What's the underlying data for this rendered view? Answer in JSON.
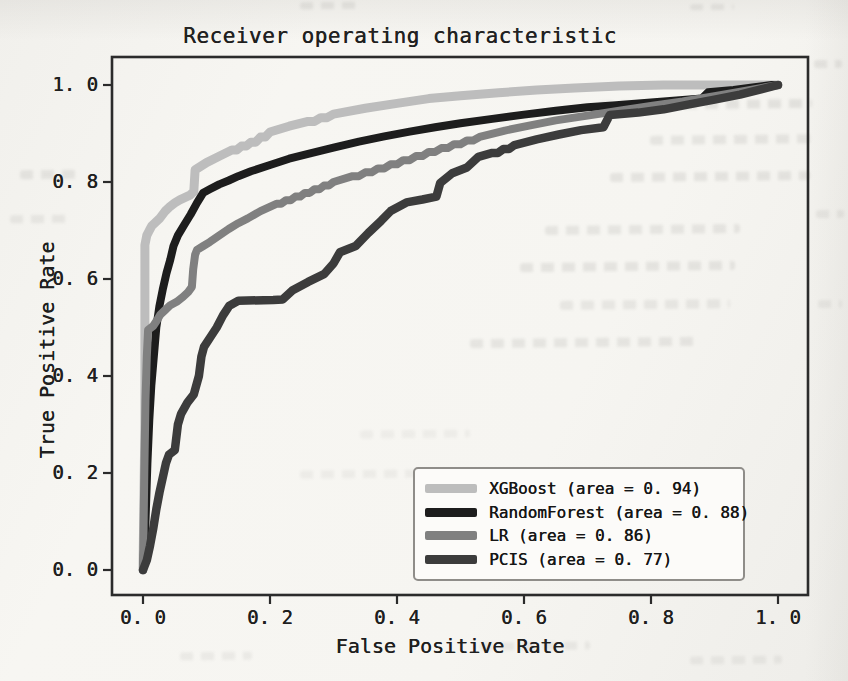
{
  "chart_data": {
    "type": "line",
    "chart_kind": "roc-curve",
    "title": "Receiver operating characteristic",
    "xlabel": "False Positive Rate",
    "ylabel": "True Positive Rate",
    "xlim": [
      -0.05,
      1.05
    ],
    "ylim": [
      -0.05,
      1.05
    ],
    "grid": false,
    "legend_position": "lower right",
    "x_ticks": {
      "values": [
        0,
        0.2,
        0.4,
        0.6,
        0.8,
        1.0
      ],
      "labels": [
        "0. 0",
        "0. 2",
        "0. 4",
        "0. 6",
        "0. 8",
        "1. 0"
      ]
    },
    "y_ticks": {
      "values": [
        0,
        0.2,
        0.4,
        0.6,
        0.8,
        1.0
      ],
      "labels": [
        "0. 0",
        "0. 2",
        "0. 4",
        "0. 6",
        "0. 8",
        "1. 0"
      ]
    },
    "series": [
      {
        "name": "XGBoost",
        "auc": 0.94,
        "color": "#bdbdbd",
        "line_width": 9,
        "legend_label": "XGBoost (area = 0. 94)",
        "points": [
          [
            0,
            0
          ],
          [
            0.003,
            0.3
          ],
          [
            0.003,
            0.67
          ],
          [
            0.006,
            0.69
          ],
          [
            0.01,
            0.7
          ],
          [
            0.014,
            0.71
          ],
          [
            0.019,
            0.716
          ],
          [
            0.027,
            0.726
          ],
          [
            0.035,
            0.74
          ],
          [
            0.043,
            0.75
          ],
          [
            0.05,
            0.757
          ],
          [
            0.058,
            0.763
          ],
          [
            0.074,
            0.773
          ],
          [
            0.08,
            0.78
          ],
          [
            0.082,
            0.825
          ],
          [
            0.1,
            0.84
          ],
          [
            0.12,
            0.853
          ],
          [
            0.14,
            0.866
          ],
          [
            0.17,
            0.882
          ],
          [
            0.2,
            0.903
          ],
          [
            0.23,
            0.915
          ],
          [
            0.26,
            0.925
          ],
          [
            0.3,
            0.94
          ],
          [
            0.35,
            0.952
          ],
          [
            0.4,
            0.962
          ],
          [
            0.45,
            0.972
          ],
          [
            0.5,
            0.978
          ],
          [
            0.56,
            0.984
          ],
          [
            0.62,
            0.99
          ],
          [
            0.68,
            0.994
          ],
          [
            0.75,
            0.998
          ],
          [
            0.82,
            1
          ],
          [
            1,
            1
          ]
        ]
      },
      {
        "name": "RandomForest",
        "auc": 0.88,
        "color": "#1d1d1d",
        "line_width": 8,
        "legend_label": "RandomForest (area = 0. 88)",
        "points": [
          [
            0,
            0
          ],
          [
            0.004,
            0.1
          ],
          [
            0.007,
            0.22
          ],
          [
            0.01,
            0.31
          ],
          [
            0.013,
            0.38
          ],
          [
            0.017,
            0.44
          ],
          [
            0.021,
            0.5
          ],
          [
            0.026,
            0.545
          ],
          [
            0.031,
            0.578
          ],
          [
            0.037,
            0.612
          ],
          [
            0.043,
            0.64
          ],
          [
            0.048,
            0.668
          ],
          [
            0.055,
            0.69
          ],
          [
            0.065,
            0.712
          ],
          [
            0.075,
            0.733
          ],
          [
            0.085,
            0.757
          ],
          [
            0.095,
            0.778
          ],
          [
            0.105,
            0.785
          ],
          [
            0.12,
            0.795
          ],
          [
            0.135,
            0.803
          ],
          [
            0.15,
            0.812
          ],
          [
            0.17,
            0.822
          ],
          [
            0.2,
            0.835
          ],
          [
            0.23,
            0.848
          ],
          [
            0.26,
            0.858
          ],
          [
            0.3,
            0.871
          ],
          [
            0.34,
            0.883
          ],
          [
            0.38,
            0.894
          ],
          [
            0.42,
            0.904
          ],
          [
            0.46,
            0.913
          ],
          [
            0.5,
            0.921
          ],
          [
            0.55,
            0.93
          ],
          [
            0.6,
            0.939
          ],
          [
            0.65,
            0.947
          ],
          [
            0.7,
            0.954
          ],
          [
            0.74,
            0.958
          ],
          [
            0.78,
            0.962
          ],
          [
            0.82,
            0.966
          ],
          [
            0.86,
            0.97
          ],
          [
            0.88,
            0.972
          ],
          [
            0.89,
            0.985
          ],
          [
            0.93,
            0.99
          ],
          [
            0.96,
            0.995
          ],
          [
            0.99,
            1
          ],
          [
            1,
            1
          ]
        ]
      },
      {
        "name": "LR",
        "auc": 0.86,
        "color": "#808080",
        "line_width": 8,
        "legend_label": "LR (area = 0. 86)",
        "points": [
          [
            0,
            0
          ],
          [
            0.002,
            0.2
          ],
          [
            0.004,
            0.35
          ],
          [
            0.006,
            0.44
          ],
          [
            0.008,
            0.495
          ],
          [
            0.016,
            0.503
          ],
          [
            0.022,
            0.515
          ],
          [
            0.027,
            0.526
          ],
          [
            0.035,
            0.536
          ],
          [
            0.043,
            0.546
          ],
          [
            0.053,
            0.553
          ],
          [
            0.063,
            0.563
          ],
          [
            0.071,
            0.573
          ],
          [
            0.077,
            0.584
          ],
          [
            0.079,
            0.62
          ],
          [
            0.082,
            0.65
          ],
          [
            0.085,
            0.66
          ],
          [
            0.095,
            0.668
          ],
          [
            0.105,
            0.676
          ],
          [
            0.12,
            0.69
          ],
          [
            0.135,
            0.703
          ],
          [
            0.15,
            0.715
          ],
          [
            0.165,
            0.725
          ],
          [
            0.185,
            0.74
          ],
          [
            0.21,
            0.755
          ],
          [
            0.24,
            0.77
          ],
          [
            0.27,
            0.785
          ],
          [
            0.3,
            0.8
          ],
          [
            0.33,
            0.812
          ],
          [
            0.37,
            0.828
          ],
          [
            0.41,
            0.845
          ],
          [
            0.45,
            0.862
          ],
          [
            0.49,
            0.878
          ],
          [
            0.53,
            0.893
          ],
          [
            0.57,
            0.906
          ],
          [
            0.61,
            0.917
          ],
          [
            0.65,
            0.927
          ],
          [
            0.7,
            0.937
          ],
          [
            0.75,
            0.947
          ],
          [
            0.8,
            0.957
          ],
          [
            0.85,
            0.966
          ],
          [
            0.9,
            0.977
          ],
          [
            0.95,
            0.988
          ],
          [
            1,
            1
          ]
        ]
      },
      {
        "name": "PCIS",
        "auc": 0.77,
        "color": "#3c3c3c",
        "line_width": 8.5,
        "legend_label": "PCIS (area = 0. 77)",
        "points": [
          [
            0,
            0
          ],
          [
            0.006,
            0.02
          ],
          [
            0.011,
            0.05
          ],
          [
            0.016,
            0.085
          ],
          [
            0.021,
            0.125
          ],
          [
            0.026,
            0.16
          ],
          [
            0.031,
            0.19
          ],
          [
            0.036,
            0.22
          ],
          [
            0.041,
            0.238
          ],
          [
            0.05,
            0.247
          ],
          [
            0.055,
            0.3
          ],
          [
            0.06,
            0.322
          ],
          [
            0.07,
            0.345
          ],
          [
            0.08,
            0.362
          ],
          [
            0.088,
            0.4
          ],
          [
            0.092,
            0.44
          ],
          [
            0.096,
            0.46
          ],
          [
            0.106,
            0.48
          ],
          [
            0.116,
            0.5
          ],
          [
            0.126,
            0.525
          ],
          [
            0.136,
            0.545
          ],
          [
            0.15,
            0.555
          ],
          [
            0.205,
            0.557
          ],
          [
            0.22,
            0.558
          ],
          [
            0.235,
            0.576
          ],
          [
            0.26,
            0.594
          ],
          [
            0.285,
            0.61
          ],
          [
            0.3,
            0.632
          ],
          [
            0.31,
            0.655
          ],
          [
            0.335,
            0.668
          ],
          [
            0.355,
            0.695
          ],
          [
            0.375,
            0.72
          ],
          [
            0.39,
            0.74
          ],
          [
            0.415,
            0.758
          ],
          [
            0.44,
            0.764
          ],
          [
            0.462,
            0.77
          ],
          [
            0.468,
            0.798
          ],
          [
            0.487,
            0.818
          ],
          [
            0.51,
            0.83
          ],
          [
            0.528,
            0.852
          ],
          [
            0.55,
            0.86
          ],
          [
            0.585,
            0.876
          ],
          [
            0.62,
            0.888
          ],
          [
            0.655,
            0.898
          ],
          [
            0.69,
            0.907
          ],
          [
            0.725,
            0.913
          ],
          [
            0.735,
            0.938
          ],
          [
            0.78,
            0.943
          ],
          [
            0.82,
            0.95
          ],
          [
            0.86,
            0.96
          ],
          [
            0.9,
            0.97
          ],
          [
            0.94,
            0.98
          ],
          [
            0.97,
            0.99
          ],
          [
            1,
            1
          ]
        ]
      }
    ]
  }
}
